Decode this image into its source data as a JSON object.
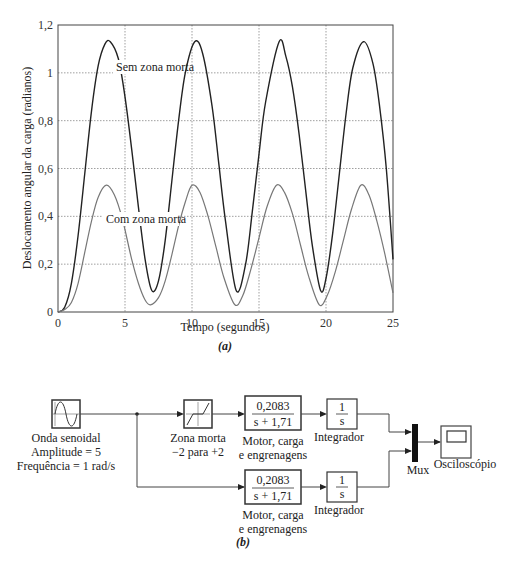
{
  "chart_data": [
    {
      "type": "line",
      "panel": "a",
      "title": "",
      "xlabel": "Tempo (segundos)",
      "ylabel": "Deslocamento angular da carga (radianos)",
      "xlim": [
        0,
        25
      ],
      "ylim": [
        0,
        1.2
      ],
      "xticks": [
        "0",
        "5",
        "10",
        "15",
        "20",
        "25"
      ],
      "yticks": [
        "0",
        "0,2",
        "0,4",
        "0,6",
        "0,8",
        "1",
        "1,2"
      ],
      "grid": true,
      "series": [
        {
          "name": "Sem zona morta",
          "color": "#222222",
          "description": "Oscillation between ~0.09 and ~1.13, period ~2π s",
          "peaks": [
            [
              3.9,
              1.13
            ],
            [
              10.2,
              1.13
            ],
            [
              16.5,
              1.13
            ],
            [
              22.8,
              1.13
            ]
          ],
          "troughs": [
            [
              7.0,
              0.09
            ],
            [
              13.3,
              0.09
            ],
            [
              19.6,
              0.09
            ]
          ],
          "x": [
            0,
            0.5,
            1,
            1.5,
            2,
            2.5,
            3,
            3.5,
            3.9,
            4.5,
            5,
            5.5,
            6,
            6.5,
            7,
            7.5,
            8,
            8.5,
            9,
            9.5,
            10.2,
            10.8,
            11.5,
            12,
            12.5,
            13.3,
            14,
            14.5,
            15,
            15.5,
            16.5,
            17,
            17.5,
            18,
            18.5,
            19,
            19.6,
            20,
            20.5,
            21,
            21.5,
            22,
            22.8,
            23.5,
            24,
            24.5,
            25
          ],
          "y": [
            0,
            0.02,
            0.12,
            0.32,
            0.58,
            0.84,
            1.03,
            1.12,
            1.13,
            1.06,
            0.9,
            0.68,
            0.44,
            0.22,
            0.09,
            0.13,
            0.3,
            0.55,
            0.8,
            1.0,
            1.13,
            1.08,
            0.86,
            0.62,
            0.38,
            0.09,
            0.2,
            0.42,
            0.66,
            0.88,
            1.13,
            1.07,
            0.94,
            0.74,
            0.5,
            0.27,
            0.09,
            0.14,
            0.33,
            0.58,
            0.83,
            1.02,
            1.13,
            1.04,
            0.86,
            0.6,
            0.22
          ]
        },
        {
          "name": "Com zona morta",
          "color": "#777777",
          "description": "Oscillation between ~0.03 and ~0.53, period ~2π s",
          "peaks": [
            [
              3.6,
              0.53
            ],
            [
              10.0,
              0.53
            ],
            [
              16.3,
              0.53
            ],
            [
              22.6,
              0.53
            ]
          ],
          "troughs": [
            [
              6.9,
              0.03
            ],
            [
              13.2,
              0.03
            ],
            [
              19.5,
              0.03
            ]
          ],
          "x": [
            0,
            0.5,
            1,
            1.5,
            2,
            2.5,
            3,
            3.6,
            4.2,
            4.8,
            5.5,
            6,
            6.5,
            6.9,
            7.5,
            8,
            8.5,
            9,
            9.5,
            10.0,
            10.6,
            11.2,
            11.8,
            12.4,
            13.2,
            13.8,
            14.4,
            15,
            15.6,
            16.3,
            16.9,
            17.5,
            18.1,
            18.7,
            19.5,
            20.1,
            20.7,
            21.3,
            21.9,
            22.6,
            23.2,
            23.8,
            24.4,
            25
          ],
          "y": [
            0,
            0.01,
            0.04,
            0.12,
            0.25,
            0.38,
            0.48,
            0.53,
            0.49,
            0.39,
            0.22,
            0.12,
            0.05,
            0.03,
            0.06,
            0.13,
            0.24,
            0.36,
            0.46,
            0.53,
            0.5,
            0.4,
            0.27,
            0.14,
            0.03,
            0.07,
            0.18,
            0.31,
            0.44,
            0.53,
            0.5,
            0.41,
            0.28,
            0.15,
            0.03,
            0.07,
            0.17,
            0.3,
            0.43,
            0.53,
            0.49,
            0.38,
            0.24,
            0.08
          ]
        }
      ],
      "annotations": [
        {
          "text": "Sem zona morta",
          "x": 5.3,
          "y": 1.0
        },
        {
          "text": "Com zona morta",
          "x": 5.0,
          "y": 0.43
        }
      ],
      "caption": "(a)"
    },
    {
      "type": "diagram",
      "panel": "b",
      "caption": "(b)"
    }
  ],
  "diagram": {
    "sine_block": {
      "label1": "Onda senoidal",
      "label2": "Amplitude = 5",
      "label3": "Frequência = 1 rad/s"
    },
    "deadzone_block": {
      "label1": "Zona morta",
      "label2": "−2 para +2"
    },
    "tf_top": {
      "numerator": "0,2083",
      "denominator": "s + 1,71",
      "label1": "Motor, carga",
      "label2": "e engrenagens"
    },
    "tf_bottom": {
      "numerator": "0,2083",
      "denominator": "s + 1,71",
      "label1": "Motor, carga",
      "label2": "e engrenagens"
    },
    "int_top": {
      "numerator": "1",
      "denominator": "s",
      "label": "Integrador"
    },
    "int_bottom": {
      "numerator": "1",
      "denominator": "s",
      "label": "Integrador"
    },
    "mux": {
      "label": "Mux"
    },
    "scope": {
      "label": "Osciloscópio"
    }
  },
  "captions": {
    "a": "(a)",
    "b": "(b)"
  }
}
